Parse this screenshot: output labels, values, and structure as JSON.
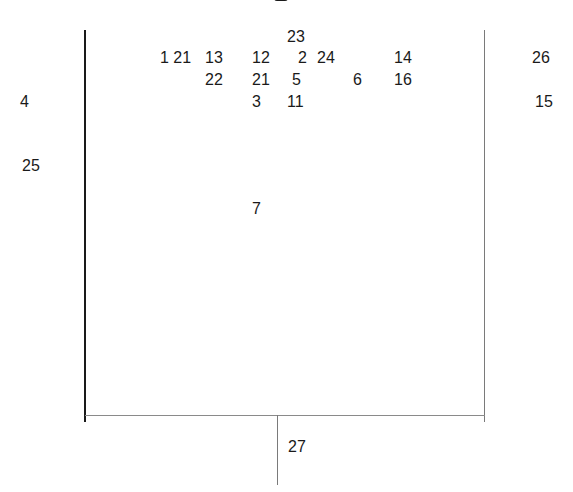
{
  "diagram": {
    "colors": {
      "text": "#1a1a1a",
      "left_line": "#1a1a1a",
      "right_line": "#7a7a7a",
      "axis_line": "#8a8a8a",
      "stem_line": "#7a7a7a"
    },
    "labels": [
      {
        "id": "l23",
        "text": "23",
        "x": 287,
        "y": 28
      },
      {
        "id": "l1-21",
        "text": "1 21",
        "x": 160,
        "y": 49
      },
      {
        "id": "l13",
        "text": "13",
        "x": 205,
        "y": 49
      },
      {
        "id": "l12",
        "text": "12",
        "x": 252,
        "y": 49
      },
      {
        "id": "l2",
        "text": "2",
        "x": 298,
        "y": 49
      },
      {
        "id": "l24",
        "text": "24",
        "x": 317,
        "y": 49
      },
      {
        "id": "l14",
        "text": "14",
        "x": 394,
        "y": 49
      },
      {
        "id": "l26",
        "text": "26",
        "x": 532,
        "y": 49
      },
      {
        "id": "l22",
        "text": "22",
        "x": 205,
        "y": 71
      },
      {
        "id": "l21",
        "text": "21",
        "x": 252,
        "y": 71
      },
      {
        "id": "l5",
        "text": "5",
        "x": 292,
        "y": 71
      },
      {
        "id": "l6",
        "text": "6",
        "x": 353,
        "y": 71
      },
      {
        "id": "l16",
        "text": "16",
        "x": 394,
        "y": 71
      },
      {
        "id": "l4",
        "text": "4",
        "x": 20,
        "y": 93
      },
      {
        "id": "l3",
        "text": "3",
        "x": 252,
        "y": 93
      },
      {
        "id": "l11",
        "text": "11",
        "x": 287,
        "y": 93
      },
      {
        "id": "l15",
        "text": "15",
        "x": 535,
        "y": 93
      },
      {
        "id": "l25",
        "text": "25",
        "x": 22,
        "y": 157
      },
      {
        "id": "l7",
        "text": "7",
        "x": 252,
        "y": 200
      },
      {
        "id": "l27",
        "text": "27",
        "x": 288,
        "y": 438
      }
    ]
  }
}
